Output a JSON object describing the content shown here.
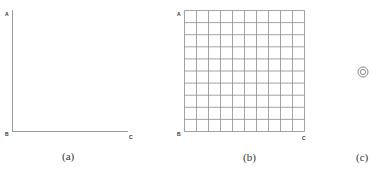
{
  "figure": {
    "colors": {
      "axis": "#9a9a9a",
      "grid": "#8c8c8c",
      "text": "#333333",
      "background": "#ffffff"
    },
    "panels": [
      {
        "id": "a",
        "caption": "(a)",
        "type": "empty-axes",
        "labels": {
          "top_left": "A",
          "origin": "B",
          "bottom_right": "C"
        }
      },
      {
        "id": "b",
        "caption": "(b)",
        "type": "grid",
        "grid_cols": 10,
        "grid_rows": 10,
        "labels": {
          "top_left": "A",
          "origin": "B",
          "bottom_right": "C"
        }
      },
      {
        "id": "c",
        "caption": "(c)",
        "type": "icon",
        "icon": "concentric-circles-icon"
      }
    ]
  }
}
